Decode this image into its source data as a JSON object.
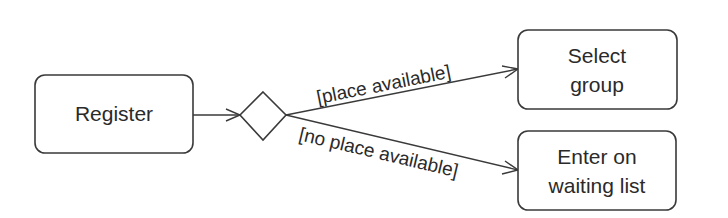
{
  "diagram": {
    "type": "uml-activity",
    "nodes": [
      {
        "id": "register",
        "kind": "action",
        "lines": [
          "Register"
        ]
      },
      {
        "id": "decision",
        "kind": "decision"
      },
      {
        "id": "select_group",
        "kind": "action",
        "lines": [
          "Select",
          "group"
        ]
      },
      {
        "id": "waiting_list",
        "kind": "action",
        "lines": [
          "Enter on",
          "waiting list"
        ]
      }
    ],
    "edges": [
      {
        "from": "register",
        "to": "decision",
        "guard": ""
      },
      {
        "from": "decision",
        "to": "select_group",
        "guard": "[place available]"
      },
      {
        "from": "decision",
        "to": "waiting_list",
        "guard": "[no place available]"
      }
    ]
  },
  "colors": {
    "stroke": "#3a3a3a",
    "text": "#2a2a2a",
    "background": "#ffffff"
  }
}
